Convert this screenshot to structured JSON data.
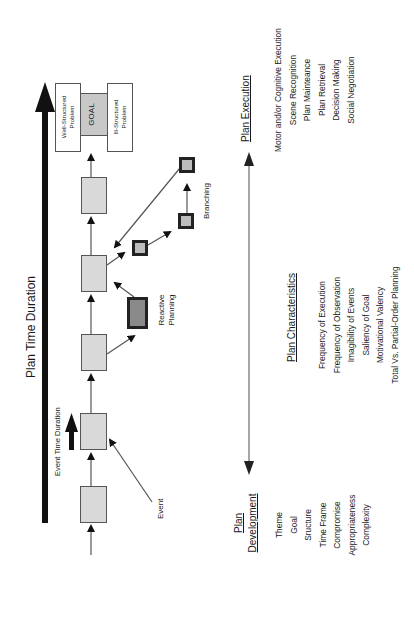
{
  "diagram": {
    "plan_time_duration_label": "Plan Time Duration",
    "event_time_duration_label": "Event Time Duration",
    "event_label": "Event",
    "reactive_planning_label": [
      "Reactive",
      "Planning"
    ],
    "branching_label": "Branching",
    "goal_label": "GOAL",
    "well_structured_label": [
      "Well-Structured",
      "Problem"
    ],
    "ill_structured_label": [
      "Ill-Structured",
      "Problem"
    ],
    "colors": {
      "step_fill": "#d9d9d9",
      "reactive_fill": "#8a8a8a",
      "branch_fill": "#bdbdbd",
      "line": "#555555",
      "bar": "#111111"
    }
  },
  "plan_execution": {
    "heading": "Plan Execution",
    "items": [
      "Motor and/or Cognitive Execution",
      "Scene Recognition",
      "Plan Mainteance",
      "Plan Retrieval",
      "Decision Making",
      "Social Negotiation"
    ]
  },
  "plan_characteristics": {
    "heading": "Plan Characteristics",
    "items": [
      "Frequency of Execution",
      "Frequency of Observation",
      "Imagibility of Events",
      "Saliency of Goal",
      "Motivational Valency",
      "Total Vs. Partial-Order Planning"
    ]
  },
  "plan_development": {
    "heading": [
      "Plan",
      "Development"
    ],
    "items": [
      "Theme",
      "Goal",
      "Sructure",
      "Time Frame",
      "Compromise",
      "Appropriateness",
      "Complexity"
    ]
  }
}
